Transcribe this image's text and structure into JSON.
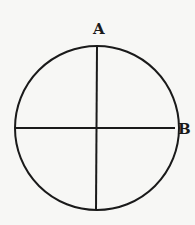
{
  "diagram": {
    "labels": {
      "a": "A",
      "b": "B"
    },
    "circle": {
      "cx": 97,
      "cy": 128,
      "r": 82
    },
    "colors": {
      "stroke": "#1a1a1a",
      "background": "#f7f7f5"
    }
  }
}
